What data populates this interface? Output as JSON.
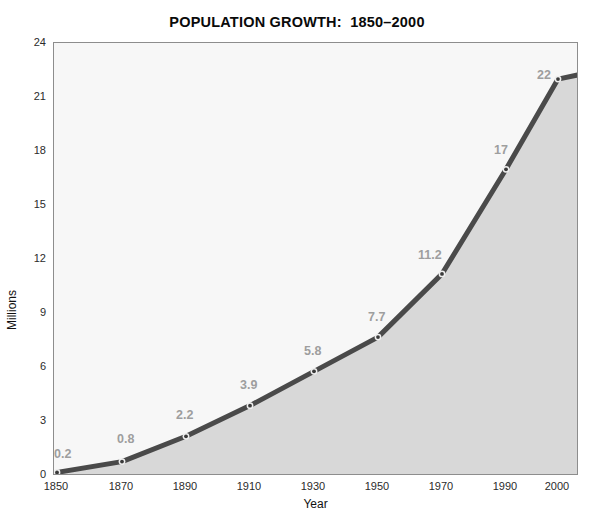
{
  "chart_data": {
    "type": "area",
    "title": "POPULATION GROWTH:  1850–2000",
    "xlabel": "Year",
    "ylabel": "Millions",
    "x": [
      1850,
      1870,
      1890,
      1910,
      1930,
      1950,
      1970,
      1990,
      2000
    ],
    "values": [
      0.2,
      0.8,
      2.2,
      3.9,
      5.8,
      7.7,
      11.2,
      17,
      22
    ],
    "point_labels": [
      "0.2",
      "0.8",
      "2.2",
      "3.9",
      "5.8",
      "7.7",
      "11.2",
      "17",
      "22"
    ],
    "categories": [
      "1850",
      "1870",
      "1890",
      "1910",
      "1930",
      "1950",
      "1970",
      "1990",
      "2000"
    ],
    "xtick_labels": [
      "1850",
      "1870",
      "1890",
      "1910",
      "1930",
      "1950",
      "1970",
      "1990",
      "2000"
    ],
    "ytick_labels": [
      "0",
      "3",
      "6",
      "9",
      "12",
      "15",
      "18",
      "21",
      "24"
    ],
    "ytick_values": [
      0,
      3,
      6,
      9,
      12,
      15,
      18,
      21,
      24
    ],
    "ylim": [
      0,
      24
    ],
    "xlim": [
      1850,
      2003
    ],
    "grid": false,
    "legend": false,
    "markers": true,
    "colors": {
      "line": "#4a4a4a",
      "fill_below": "#d8d8d8",
      "plot_background": "#f7f7f7",
      "axis": "#8d8d8d",
      "tick_text": "#2b2b2b",
      "point_label": "#9e9e9e",
      "title": "#0a0a0a"
    }
  }
}
